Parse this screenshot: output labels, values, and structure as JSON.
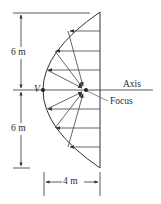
{
  "figure": {
    "labels": {
      "top_dimension": "6 m",
      "bottom_dimension": "6 m",
      "width_dimension": "4 m",
      "vertex": "V",
      "axis": "Axis",
      "focus": "Focus"
    },
    "geometry": {
      "half_height_m": 6,
      "depth_m": 4,
      "shape": "parabola",
      "incoming_rays_count": 6
    },
    "colors": {
      "line": "#333333",
      "background": "#ffffff"
    }
  }
}
